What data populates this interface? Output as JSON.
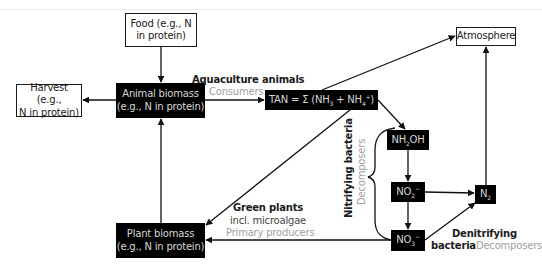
{
  "diagram": {
    "type": "nitrogen-cycle-flow",
    "nodes": {
      "food": {
        "line1": "Food (e.g., N",
        "line2": "in protein)",
        "style": "white"
      },
      "harvest": {
        "line1": "Harvest (e.g.,",
        "line2": "N in protein)",
        "style": "white"
      },
      "animal_biomass": {
        "line1": "Animal biomass",
        "line2": "(e.g., N in protein)",
        "style": "black"
      },
      "tan": {
        "prefix": "TAN = Σ (NH",
        "sub1": "3",
        "mid": " + NH",
        "sub2": "4",
        "sup2": "+",
        "suffix": ")",
        "style": "black"
      },
      "atmosphere": {
        "text": "Atmosphere",
        "style": "white"
      },
      "nh2oh": {
        "prefix": "NH",
        "sub": "2",
        "suffix": "OH",
        "style": "black"
      },
      "no2": {
        "prefix": "NO",
        "sub": "2",
        "sup": "−",
        "style": "black"
      },
      "n2": {
        "prefix": "N",
        "sub": "2",
        "style": "black"
      },
      "no3": {
        "prefix": "NO",
        "sub": "3",
        "sup": "−",
        "style": "black"
      },
      "plant_biomass": {
        "line1": "Plant biomass",
        "line2": "(e.g., N in protein)",
        "style": "black"
      }
    },
    "labels": {
      "aquaculture": {
        "title": "Aquaculture animals",
        "role": "Consumers"
      },
      "green_plants": {
        "title": "Green plants",
        "sub": "incl. microalgae",
        "role": "Primary producers"
      },
      "nitrifying": {
        "title": "Nitrifying bacteria",
        "role": "Decomposers"
      },
      "denitrifying": {
        "title1": "Denitrifying",
        "title2": "bacteria",
        "role": "Decomposers"
      }
    },
    "edges": [
      {
        "from": "food",
        "to": "animal_biomass"
      },
      {
        "from": "animal_biomass",
        "to": "harvest"
      },
      {
        "from": "animal_biomass",
        "to": "tan"
      },
      {
        "from": "plant_biomass",
        "to": "animal_biomass"
      },
      {
        "from": "tan",
        "to": "atmosphere"
      },
      {
        "from": "tan",
        "to": "plant_biomass"
      },
      {
        "from": "tan",
        "to": "nh2oh"
      },
      {
        "from": "nh2oh",
        "to": "no2"
      },
      {
        "from": "no2",
        "to": "no3"
      },
      {
        "from": "no2",
        "to": "n2"
      },
      {
        "from": "no3",
        "to": "n2"
      },
      {
        "from": "no3",
        "to": "plant_biomass"
      },
      {
        "from": "n2",
        "to": "atmosphere"
      }
    ],
    "colors": {
      "box_black": "#000000",
      "box_text": "#d8d8d8",
      "line": "#1a1a1a",
      "role_grey": "#a0a0a0"
    }
  }
}
